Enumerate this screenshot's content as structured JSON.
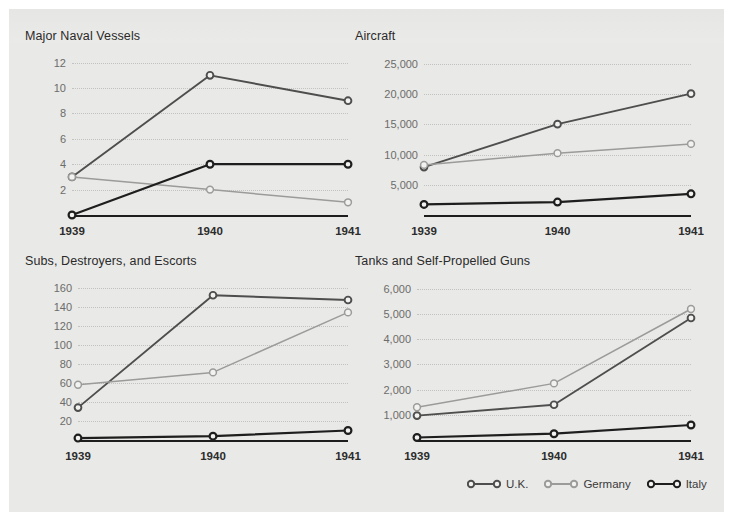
{
  "page": {
    "background": "#e9e9e7",
    "border": "#ffffff"
  },
  "series_styles": [
    {
      "key": "uk",
      "name": "U.K.",
      "color": "#4e4e4e",
      "width": 1.9
    },
    {
      "key": "germany",
      "name": "Germany",
      "color": "#9b9b99",
      "width": 1.5
    },
    {
      "key": "italy",
      "name": "Italy",
      "color": "#1e1e1e",
      "width": 2.2
    }
  ],
  "legend": {
    "items": [
      {
        "label": "U.K.",
        "color": "#4e4e4e"
      },
      {
        "label": "Germany",
        "color": "#9b9b99"
      },
      {
        "label": "Italy",
        "color": "#1e1e1e"
      }
    ]
  },
  "chart_data": [
    {
      "id": "major-naval-vessels",
      "type": "line",
      "title": "Major Naval Vessels",
      "xlabel": "",
      "ylabel": "",
      "categories": [
        "1939",
        "1940",
        "1941"
      ],
      "yticks": [
        2,
        4,
        6,
        8,
        10,
        12
      ],
      "ylim": [
        0,
        12.6
      ],
      "grid": true,
      "legend_position": "none",
      "series": [
        {
          "name": "U.K.",
          "values": [
            3,
            11,
            9
          ]
        },
        {
          "name": "Germany",
          "values": [
            3,
            2,
            1
          ]
        },
        {
          "name": "Italy",
          "values": [
            0,
            4,
            4
          ]
        }
      ]
    },
    {
      "id": "aircraft",
      "type": "line",
      "title": "Aircraft",
      "xlabel": "",
      "ylabel": "",
      "categories": [
        "1939",
        "1940",
        "1941"
      ],
      "yticks": [
        5000,
        10000,
        15000,
        20000,
        25000
      ],
      "ytick_labels": [
        "5,000",
        "10,000",
        "15,000",
        "20,000",
        "25,000"
      ],
      "ylim": [
        0,
        26500
      ],
      "grid": true,
      "legend_position": "none",
      "series": [
        {
          "name": "U.K.",
          "values": [
            7940,
            15049,
            20094
          ]
        },
        {
          "name": "Germany",
          "values": [
            8295,
            10247,
            11776
          ]
        },
        {
          "name": "Italy",
          "values": [
            1750,
            2142,
            3503
          ]
        }
      ]
    },
    {
      "id": "subs-destroyers-escorts",
      "type": "line",
      "title": "Subs, Destroyers, and Escorts",
      "xlabel": "",
      "ylabel": "",
      "categories": [
        "1939",
        "1940",
        "1941"
      ],
      "yticks": [
        20,
        40,
        60,
        80,
        100,
        120,
        140,
        160
      ],
      "ylim": [
        0,
        168
      ],
      "grid": true,
      "legend_position": "none",
      "series": [
        {
          "name": "U.K.",
          "values": [
            34,
            152,
            147
          ]
        },
        {
          "name": "Germany",
          "values": [
            58,
            71,
            134
          ]
        },
        {
          "name": "Italy",
          "values": [
            2,
            4,
            10
          ]
        }
      ]
    },
    {
      "id": "tanks-and-self-propelled-guns",
      "type": "line",
      "title": "Tanks and Self-Propelled Guns",
      "xlabel": "",
      "ylabel": "",
      "categories": [
        "1939",
        "1940",
        "1941"
      ],
      "yticks": [
        1000,
        2000,
        3000,
        4000,
        5000,
        6000
      ],
      "ytick_labels": [
        "1,000",
        "2,000",
        "3,000",
        "4,000",
        "5,000",
        "6,000"
      ],
      "ylim": [
        0,
        6350
      ],
      "grid": true,
      "legend_position": "bottom-right",
      "series": [
        {
          "name": "U.K.",
          "values": [
            969,
            1399,
            4841
          ]
        },
        {
          "name": "Germany",
          "values": [
            1300,
            2247,
            5200
          ]
        },
        {
          "name": "Italy",
          "values": [
            100,
            250,
            595
          ]
        }
      ]
    }
  ]
}
